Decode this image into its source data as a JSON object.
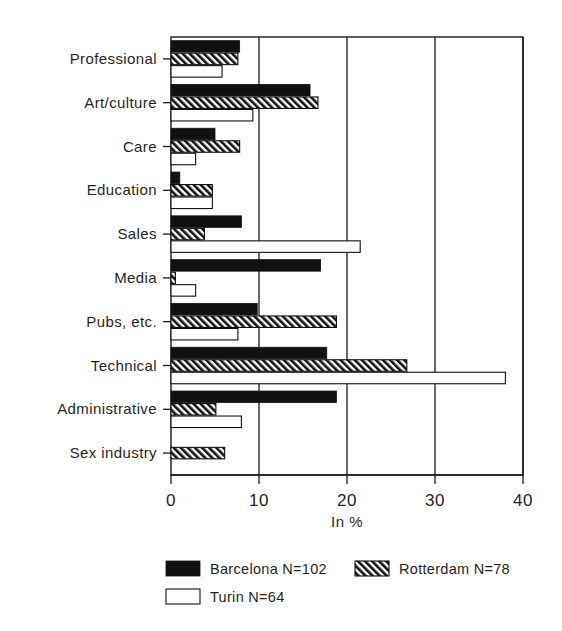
{
  "chart_data": {
    "type": "bar",
    "orientation": "horizontal",
    "title": "",
    "xlabel": "In %",
    "ylabel": "",
    "xlim": [
      0,
      40
    ],
    "xticks": [
      0,
      10,
      20,
      30,
      40
    ],
    "xtick_labels": [
      "0",
      "10",
      "20",
      "30",
      "40"
    ],
    "grid": true,
    "grid_axis": "x",
    "legend_position": "bottom",
    "categories": [
      "Professional",
      "Art/culture",
      "Care",
      "Education",
      "Sales",
      "Media",
      "Pubs, etc.",
      "Technical",
      "Administrative",
      "Sex industry"
    ],
    "series": [
      {
        "name": "Barcelona N=102",
        "short_name": "Barcelona",
        "n": 102,
        "style": "solid-black",
        "color": "#111111",
        "values": [
          7.8,
          15.8,
          5.0,
          1.0,
          8.0,
          17.0,
          9.8,
          17.7,
          18.8,
          0
        ]
      },
      {
        "name": "Rotterdam N=78",
        "short_name": "Rotterdam",
        "n": 78,
        "style": "diagonal-hatch",
        "color": "#111111",
        "values": [
          7.6,
          16.7,
          7.8,
          4.7,
          3.8,
          0.5,
          18.8,
          26.8,
          5.1,
          6.1
        ]
      },
      {
        "name": "Turin N=64",
        "short_name": "Turin",
        "n": 64,
        "style": "white-outline",
        "color": "#ffffff",
        "values": [
          5.8,
          9.3,
          2.8,
          4.7,
          21.5,
          2.8,
          7.6,
          38.0,
          8.0,
          0
        ]
      }
    ]
  },
  "legend": {
    "entries": [
      {
        "label": "Barcelona N=102",
        "style": "solid-black"
      },
      {
        "label": "Rotterdam N=78",
        "style": "diagonal-hatch"
      },
      {
        "label": "Turin N=64",
        "style": "white-outline"
      }
    ]
  },
  "axis": {
    "x_title": "In %"
  }
}
